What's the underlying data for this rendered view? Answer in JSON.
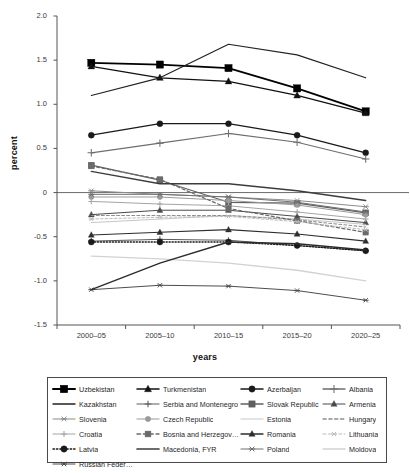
{
  "chart_data": {
    "type": "line",
    "title": "",
    "xlabel": "years",
    "ylabel": "percent",
    "ylim": [
      -1.5,
      2.0
    ],
    "yticks": [
      "2.0",
      "1.5",
      "1.0",
      "0.5",
      "0",
      "-0.5",
      "-1.0",
      "-1.5"
    ],
    "ytick_values": [
      2.0,
      1.5,
      1.0,
      0.5,
      0.0,
      -0.5,
      -1.0,
      -1.5
    ],
    "grid": false,
    "zero_line": true,
    "legend_position": "below",
    "categories": [
      "2000–05",
      "2005–10",
      "2010–15",
      "2015–20",
      "2020–25"
    ],
    "series": [
      {
        "name": "Uzbekistan",
        "values": [
          1.47,
          1.45,
          1.41,
          1.18,
          0.92
        ],
        "color": "#000000",
        "marker": "square",
        "dash": "none",
        "width": 1.7,
        "msize": 3.6
      },
      {
        "name": "Turkmenistan",
        "values": [
          1.43,
          1.3,
          1.26,
          1.1,
          0.9
        ],
        "color": "#111111",
        "marker": "triangle",
        "dash": "none",
        "width": 1.3,
        "msize": 3.2
      },
      {
        "name": "Azerbaijan",
        "values": [
          0.65,
          0.78,
          0.78,
          0.65,
          0.45
        ],
        "color": "#1a1a1a",
        "marker": "circle",
        "dash": "none",
        "width": 1.3,
        "msize": 3.0
      },
      {
        "name": "Albania",
        "values": [
          0.45,
          0.56,
          0.67,
          0.57,
          0.38
        ],
        "color": "#6e6e6e",
        "marker": "plus",
        "dash": "none",
        "width": 1.1,
        "msize": 3.4
      },
      {
        "name": "Kazakhstan",
        "values": [
          1.1,
          1.3,
          1.68,
          1.56,
          1.3
        ],
        "color": "#222222",
        "marker": "none",
        "dash": "none",
        "width": 1.2,
        "msize": 2.4
      },
      {
        "name": "Serbia and Montenegro",
        "values": [
          -0.55,
          -0.53,
          -0.54,
          -0.6,
          -0.66
        ],
        "color": "#5a5a5a",
        "marker": "plus",
        "dash": "none",
        "width": 1.0,
        "msize": 2.8
      },
      {
        "name": "Slovak Republic",
        "values": [
          0.31,
          0.14,
          -0.11,
          -0.12,
          -0.23
        ],
        "color": "#5f5f5f",
        "marker": "square",
        "dash": "none",
        "width": 1.2,
        "msize": 3.0
      },
      {
        "name": "Armenia",
        "values": [
          -0.25,
          -0.2,
          -0.2,
          -0.27,
          -0.34
        ],
        "color": "#4a4a4a",
        "marker": "triangle",
        "dash": "none",
        "width": 1.0,
        "msize": 2.8
      },
      {
        "name": "Slovenia",
        "values": [
          0.02,
          -0.02,
          -0.05,
          -0.09,
          -0.16
        ],
        "color": "#8c8c8c",
        "marker": "star",
        "dash": "none",
        "width": 1.0,
        "msize": 3.0
      },
      {
        "name": "Czech Republic",
        "values": [
          -0.05,
          -0.05,
          -0.09,
          -0.14,
          -0.25
        ],
        "color": "#9a9a9a",
        "marker": "circle",
        "dash": "none",
        "width": 1.0,
        "msize": 2.6
      },
      {
        "name": "Estonia",
        "values": [
          -0.34,
          -0.3,
          -0.26,
          -0.3,
          -0.36
        ],
        "color": "#c7c7c7",
        "marker": "none",
        "dash": "none",
        "width": 1.0,
        "msize": 2.2
      },
      {
        "name": "Hungary",
        "values": [
          -0.26,
          -0.26,
          -0.26,
          -0.31,
          -0.39
        ],
        "color": "#8e8e8e",
        "marker": "none",
        "dash": "dash",
        "width": 1.1,
        "msize": 2.2
      },
      {
        "name": "Croatia",
        "values": [
          -0.1,
          -0.13,
          -0.15,
          -0.22,
          -0.3
        ],
        "color": "#a5a5a5",
        "marker": "plus",
        "dash": "none",
        "width": 1.0,
        "msize": 2.6
      },
      {
        "name": "Bosnia and Herzegovina",
        "values": [
          0.3,
          0.15,
          -0.18,
          -0.32,
          -0.45
        ],
        "color": "#6b6b6b",
        "marker": "square",
        "dash": "dash",
        "width": 1.2,
        "msize": 2.8
      },
      {
        "name": "Romania",
        "values": [
          -0.48,
          -0.45,
          -0.42,
          -0.47,
          -0.55
        ],
        "color": "#2e2e2e",
        "marker": "triangle",
        "dash": "none",
        "width": 1.1,
        "msize": 2.8
      },
      {
        "name": "Lithuania",
        "values": [
          -0.3,
          -0.28,
          -0.27,
          -0.33,
          -0.42
        ],
        "color": "#bdbdbd",
        "marker": "star",
        "dash": "dash",
        "width": 1.0,
        "msize": 2.6
      },
      {
        "name": "Latvia",
        "values": [
          -0.56,
          -0.56,
          -0.56,
          -0.6,
          -0.66
        ],
        "color": "#1a1a1a",
        "marker": "circle",
        "dash": "dot",
        "width": 1.3,
        "msize": 3.0
      },
      {
        "name": "Macedonia, FYR",
        "values": [
          0.24,
          0.1,
          0.1,
          0.02,
          -0.09
        ],
        "color": "#3c3c3c",
        "marker": "none",
        "dash": "none",
        "width": 1.4,
        "msize": 2.2
      },
      {
        "name": "Poland",
        "values": [
          -0.02,
          -0.02,
          -0.05,
          -0.11,
          -0.22
        ],
        "color": "#707070",
        "marker": "star",
        "dash": "none",
        "width": 1.0,
        "msize": 3.0
      },
      {
        "name": "Moldova",
        "values": [
          -0.72,
          -0.75,
          -0.8,
          -0.88,
          -1.0
        ],
        "color": "#d2d2d2",
        "marker": "none",
        "dash": "none",
        "width": 1.3,
        "msize": 2.2
      },
      {
        "name": "Russian Federation",
        "values": [
          -1.1,
          -1.05,
          -1.06,
          -1.11,
          -1.22
        ],
        "color": "#4d4d4d",
        "marker": "star",
        "dash": "none",
        "width": 1.0,
        "msize": 2.8
      },
      {
        "name": "_bridge",
        "values": [
          -1.1,
          -0.8,
          -0.56,
          -0.58,
          -0.65
        ],
        "color": "#2b2b2b",
        "marker": "none",
        "dash": "none",
        "width": 1.4,
        "msize": 2.0
      }
    ]
  },
  "legend": {
    "rows": [
      [
        {
          "label": "Uzbekistan",
          "series": 0
        },
        {
          "label": "Turkmenistan",
          "series": 1
        },
        {
          "label": "Azerbaijan",
          "series": 2
        },
        {
          "label": "Albania",
          "series": 3
        }
      ],
      [
        {
          "label": "Kazakhstan",
          "series": 4
        },
        {
          "label": "Serbia and Montenegro",
          "series": 5
        },
        {
          "label": "Slovak Republic",
          "series": 6
        },
        {
          "label": "Armenia",
          "series": 7
        }
      ],
      [
        {
          "label": "Slovenia",
          "series": 8
        },
        {
          "label": "Czech Republic",
          "series": 9
        },
        {
          "label": "Estonia",
          "series": 10
        },
        {
          "label": "Hungary",
          "series": 11
        }
      ],
      [
        {
          "label": "Croatia",
          "series": 12
        },
        {
          "label": "Bosnia and Herzegovina",
          "series": 13
        },
        {
          "label": "Romania",
          "series": 14
        },
        {
          "label": "Lithuania",
          "series": 15
        }
      ],
      [
        {
          "label": "Latvia",
          "series": 16
        },
        {
          "label": "Macedonia, FYR",
          "series": 17
        },
        {
          "label": "Poland",
          "series": 18
        },
        {
          "label": "Moldova",
          "series": 19
        }
      ],
      [
        {
          "label": "Russian Federation",
          "series": 20
        }
      ]
    ]
  }
}
